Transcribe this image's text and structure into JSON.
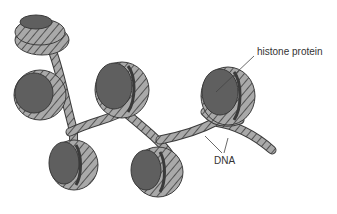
{
  "diagram": {
    "labels": {
      "histone": "histone protein",
      "dna": "DNA"
    },
    "colors": {
      "histone_fill": "#5f5f5f",
      "histone_dark": "#3a3a3a",
      "dna_fill": "#a9a9a9",
      "dna_stroke": "#3c3c3c",
      "leader_line": "#444444",
      "background": "#ffffff"
    },
    "nucleosomes": [
      {
        "id": "n1",
        "cx": 38,
        "cy": 33
      },
      {
        "id": "n2",
        "cx": 32,
        "cy": 92
      },
      {
        "id": "n3",
        "cx": 120,
        "cy": 88
      },
      {
        "id": "n4",
        "cx": 70,
        "cy": 166
      },
      {
        "id": "n5",
        "cx": 152,
        "cy": 172
      },
      {
        "id": "n6",
        "cx": 226,
        "cy": 96
      }
    ]
  }
}
